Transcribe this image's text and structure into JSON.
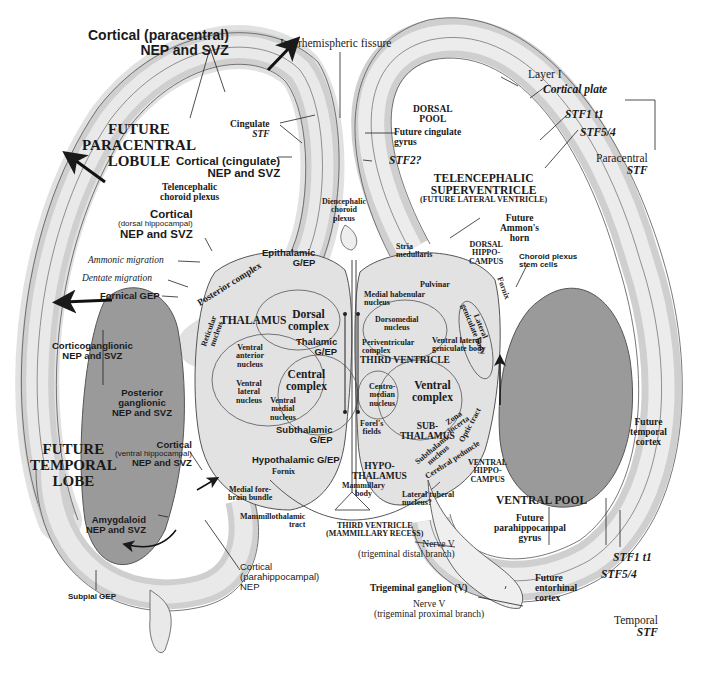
{
  "figure": {
    "regions": {
      "future_paracentral_lobule": [
        "FUTURE",
        "PARACENTRAL",
        "LOBULE"
      ],
      "future_temporal_lobe": [
        "FUTURE",
        "TEMPORAL",
        "LOBE"
      ],
      "dorsal_pool": [
        "DORSAL",
        "POOL"
      ],
      "ventral_pool": "VENTRAL POOL",
      "telencephalic_superventricle": [
        "TELENCEPHALIC",
        "SUPERVENTRICLE"
      ],
      "superventricle_sub": "(FUTURE LATERAL VENTRICLE)",
      "thalamus": "THALAMUS",
      "third_ventricle": "THIRD VENTRICLE",
      "subthalamus": [
        "SUB-",
        "THALAMUS"
      ],
      "hypothalamus": [
        "HYPO-",
        "THALAMUS"
      ],
      "dorsal_hippocampus": [
        "DORSAL",
        "HIPPO-",
        "CAMPUS"
      ],
      "ventral_hippocampus": [
        "VENTRAL",
        "HIPPO-",
        "CAMPUS"
      ],
      "third_ventricle_mammillary": [
        "THIRD VENTRICLE",
        "(MAMMILLARY RECESS)"
      ]
    },
    "left_labels": {
      "cortical_paracentral": [
        "Cortical (paracentral)",
        "NEP and SVZ"
      ],
      "interhemispheric_fissure": "Interhemispheric fissure",
      "cingulate": "Cingulate",
      "cingulate_stf": "STF",
      "cortical_cingulate": [
        "Cortical (cingulate)",
        "NEP and SVZ"
      ],
      "telencephalic_choroid": [
        "Telencephalic",
        "choroid plexus"
      ],
      "cortical_dorsal_hippo": [
        "Cortical",
        "(dorsal hippocampal)",
        "NEP and SVZ"
      ],
      "ammonic_migration": "Ammonic migration",
      "dentate_migration": "Dentate migration",
      "fornical_gep": "Fornical GEP",
      "corticoganglionic": [
        "Corticoganglionic",
        "NEP and SVZ"
      ],
      "posterior_ganglionic": [
        "Posterior",
        "ganglionic",
        "NEP and SVZ"
      ],
      "cortical_ventral_hippo": [
        "Cortical",
        "(ventral hippocampal)",
        "NEP and SVZ"
      ],
      "amygdaloid": [
        "Amygdaloid",
        "NEP and SVZ"
      ],
      "subpial_gep": "Subpial GEP",
      "cortical_parahippocampal": [
        "Cortical",
        "(parahippocampal)",
        "NEP"
      ],
      "medial_forebrain_bundle": [
        "Medial fore-",
        "brain bundle"
      ],
      "mammillothalamic_tract": [
        "Mammillothalamic",
        "tract"
      ]
    },
    "thalamus_labels": {
      "diencephalic_choroid": [
        "Diencephalic",
        "choroid",
        "plexus"
      ],
      "epithalamic": [
        "Epithalamic",
        "G/EP"
      ],
      "posterior_complex": "Posterior complex",
      "dorsal_complex": [
        "Dorsal",
        "complex"
      ],
      "thalamic_gep": [
        "Thalamic",
        "G/EP"
      ],
      "reticular_nucleus": [
        "Reticular",
        "nucleus"
      ],
      "ventral_anterior": [
        "Ventral",
        "anterior",
        "nucleus"
      ],
      "ventral_lateral": [
        "Ventral",
        "lateral",
        "nucleus"
      ],
      "ventral_medial": [
        "Ventral",
        "medial",
        "nucleus"
      ],
      "central_complex": [
        "Central",
        "complex"
      ],
      "subthalamic_gep": [
        "Subthalamic",
        "G/EP"
      ],
      "hypothalamic_gep": "Hypothalamic G/EP",
      "fornix": "Fornix",
      "mammillary_body": [
        "Mammillary",
        "body"
      ],
      "lateral_tuberal": [
        "Lateral tuberal",
        "nucleus?"
      ]
    },
    "right_thalamus_labels": {
      "stria_medullaris": [
        "Stria",
        "medullaris"
      ],
      "pulvinar": "Pulvinar",
      "medial_habenular": [
        "Medial habenular",
        "nucleus"
      ],
      "dorsomedial": [
        "Dorsomedial",
        "nucleus"
      ],
      "periventricular": [
        "Periventricular",
        "complex"
      ],
      "ventral_lateral_geniculate": [
        "Ventral lateral",
        "geniculate body"
      ],
      "lateral_geniculate": [
        "Lateral",
        "geniculate body"
      ],
      "fornix_r": "Fornix",
      "centromedian": [
        "Centro-",
        "median",
        "nucleus"
      ],
      "ventral_complex": [
        "Ventral",
        "complex"
      ],
      "forels_fields": [
        "Forel's",
        "fields"
      ],
      "zona_incerta": [
        "Zona",
        "incerta"
      ],
      "subthalamic_nucleus": [
        "Subthalamic",
        "nucleus"
      ],
      "cerebral_peduncle": "Cerebral peduncle",
      "optic_tract": "Optic tract"
    },
    "right_labels": {
      "layer_i": "Layer I",
      "cortical_plate": "Cortical plate",
      "future_cingulate_gyrus": [
        "Future cingulate",
        "gyrus"
      ],
      "stf2": "STF2?",
      "stf1_t1": "STF1 t1",
      "stf5_4": "STF5/4",
      "paracentral_stf": [
        "Paracentral",
        "STF"
      ],
      "future_ammons_horn": [
        "Future",
        "Ammon's",
        "horn"
      ],
      "choroid_plexus_stem": [
        "Choroid plexus",
        "stem cells"
      ],
      "future_temporal_cortex": [
        "Future",
        "temporal",
        "cortex"
      ],
      "future_parahippocampal": [
        "Future",
        "parahippocampal",
        "gyrus"
      ],
      "future_entorhinal": [
        "Future",
        "entorhinal",
        "cortex"
      ],
      "stf1_t1_b": "STF1 t1",
      "stf5_4_b": "STF5/4",
      "temporal_stf": [
        "Temporal",
        "STF"
      ],
      "nerve_v_distal": [
        "Nerve V",
        "(trigeminal distal branch)"
      ],
      "trigeminal_ganglion": "Trigeminal ganglion (V)",
      "nerve_v_proximal": [
        "Nerve V",
        "(trigeminal proximal branch)"
      ]
    },
    "colors": {
      "ink": "#1a1a1a",
      "band_light": "#e6e6e6",
      "band_mid": "#cfcfcf",
      "band_dark": "#a8a8a8",
      "ganglionic_fill": "#9a9a9a",
      "thalamus_fill": "#e2e2e2"
    }
  }
}
